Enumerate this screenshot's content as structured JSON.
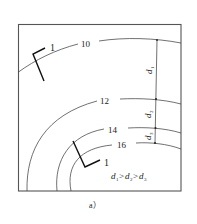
{
  "figure": {
    "caption": "a）",
    "frame_color": "#555555",
    "line_color": "#333333"
  },
  "contours": [
    {
      "label": "10"
    },
    {
      "label": "12"
    },
    {
      "label": "14"
    },
    {
      "label": "16"
    }
  ],
  "section_markers": [
    {
      "label": "1"
    },
    {
      "label": "1"
    }
  ],
  "distances": [
    {
      "symbol": "d",
      "sub": "1"
    },
    {
      "symbol": "d",
      "sub": "2"
    },
    {
      "symbol": "d",
      "sub": "3"
    }
  ],
  "relation": {
    "d": "d",
    "s1": "1",
    "gt": ">",
    "s2": "2",
    "s3": "3"
  }
}
